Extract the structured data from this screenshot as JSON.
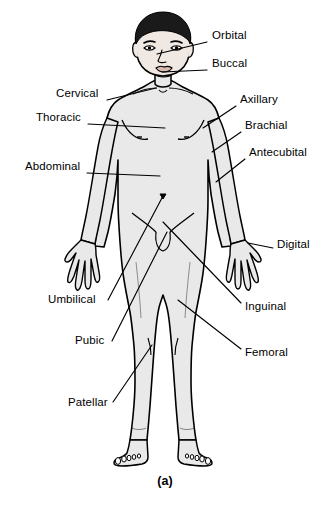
{
  "figure": {
    "caption": "(a)",
    "view": "anterior"
  },
  "colors": {
    "outline": "#000000",
    "body_fill": "#e9e9e9",
    "hair_fill": "#1a1a1a",
    "background": "#ffffff",
    "leader_line": "#000000",
    "label_text": "#000000"
  },
  "labels": [
    {
      "id": "orbital",
      "text": "Orbital",
      "side": "right",
      "text_x": 212,
      "text_y": 36,
      "leader_start_x": 207,
      "leader_start_y": 42,
      "leader_end_x": 157,
      "leader_end_y": 54
    },
    {
      "id": "buccal",
      "text": "Buccal",
      "side": "right",
      "text_x": 212,
      "text_y": 64,
      "leader_start_x": 207,
      "leader_start_y": 70,
      "leader_end_x": 162,
      "leader_end_y": 72
    },
    {
      "id": "cervical",
      "text": "Cervical",
      "side": "left",
      "text_x": 56,
      "text_y": 94,
      "leader_start_x": 107,
      "leader_start_y": 100,
      "leader_end_x": 156,
      "leader_end_y": 88
    },
    {
      "id": "thoracic",
      "text": "Thoracic",
      "side": "left",
      "text_x": 36,
      "text_y": 118,
      "leader_start_x": 88,
      "leader_start_y": 124,
      "leader_end_x": 165,
      "leader_end_y": 128
    },
    {
      "id": "abdominal",
      "text": "Abdominal",
      "side": "left",
      "text_x": 25,
      "text_y": 167,
      "leader_start_x": 87,
      "leader_start_y": 173,
      "leader_end_x": 160,
      "leader_end_y": 176
    },
    {
      "id": "axillary",
      "text": "Axillary",
      "side": "right",
      "text_x": 240,
      "text_y": 100,
      "leader_start_x": 236,
      "leader_start_y": 106,
      "leader_end_x": 203,
      "leader_end_y": 128
    },
    {
      "id": "brachial",
      "text": "Brachial",
      "side": "right",
      "text_x": 245,
      "text_y": 126,
      "leader_start_x": 241,
      "leader_start_y": 132,
      "leader_end_x": 212,
      "leader_end_y": 152
    },
    {
      "id": "antecubital",
      "text": "Antecubital",
      "side": "right",
      "text_x": 249,
      "text_y": 153,
      "leader_start_x": 245,
      "leader_start_y": 159,
      "leader_end_x": 216,
      "leader_end_y": 182
    },
    {
      "id": "digital",
      "text": "Digital",
      "side": "right",
      "text_x": 277,
      "text_y": 245,
      "leader_start_x": 273,
      "leader_start_y": 248,
      "leader_end_x": 248,
      "leader_end_y": 243
    },
    {
      "id": "umbilical",
      "text": "Umbilical",
      "side": "left",
      "text_x": 48,
      "text_y": 300,
      "leader_start_x": 108,
      "leader_start_y": 300,
      "leader_end_x": 163,
      "leader_end_y": 196
    },
    {
      "id": "pubic",
      "text": "Pubic",
      "side": "left",
      "text_x": 75,
      "text_y": 341,
      "leader_start_x": 112,
      "leader_start_y": 341,
      "leader_end_x": 167,
      "leader_end_y": 232
    },
    {
      "id": "patellar",
      "text": "Patellar",
      "side": "left",
      "text_x": 68,
      "text_y": 403,
      "leader_start_x": 113,
      "leader_start_y": 402,
      "leader_end_x": 152,
      "leader_end_y": 345
    },
    {
      "id": "inguinal",
      "text": "Inguinal",
      "side": "right",
      "text_x": 245,
      "text_y": 307,
      "leader_start_x": 241,
      "leader_start_y": 303,
      "leader_end_x": 163,
      "leader_end_y": 222
    },
    {
      "id": "femoral",
      "text": "Femoral",
      "side": "right",
      "text_x": 245,
      "text_y": 353,
      "leader_start_x": 241,
      "leader_start_y": 349,
      "leader_end_x": 178,
      "leader_end_y": 300
    }
  ]
}
